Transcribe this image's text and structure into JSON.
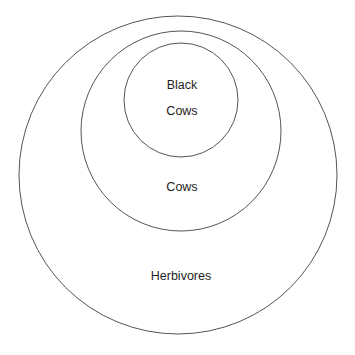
{
  "diagram": {
    "type": "nested-venn",
    "stroke_color": "#555555",
    "background": "#ffffff",
    "sets": [
      {
        "name": "Herbivores",
        "label": "Herbivores",
        "cx": 178,
        "cy": 175,
        "r": 159,
        "label_x": 181,
        "label_y": 276
      },
      {
        "name": "Cows",
        "label": "Cows",
        "cx": 181,
        "cy": 131,
        "r": 100,
        "label_x": 182,
        "label_y": 187
      },
      {
        "name": "Black Cows",
        "label_line1": "Black",
        "label_line2": "Cows",
        "cx": 181,
        "cy": 100,
        "r": 57,
        "label1_x": 182,
        "label1_y": 85,
        "label2_x": 182,
        "label2_y": 111
      }
    ]
  }
}
